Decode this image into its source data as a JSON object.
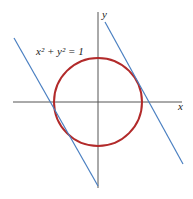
{
  "diagram": {
    "equation_label": "x² + y² = 1",
    "x_axis_label": "x",
    "y_axis_label": "y",
    "colors": {
      "circle": "#b22a2a",
      "lines": "#4a7fc1",
      "axes": "#555555"
    },
    "circle": {
      "cx": 98,
      "cy": 102,
      "r": 44
    },
    "tangent_lines": [
      {
        "x1": 14,
        "y1": 38,
        "x2": 98,
        "y2": 186
      },
      {
        "x1": 105,
        "y1": 22,
        "x2": 183,
        "y2": 164
      }
    ]
  }
}
